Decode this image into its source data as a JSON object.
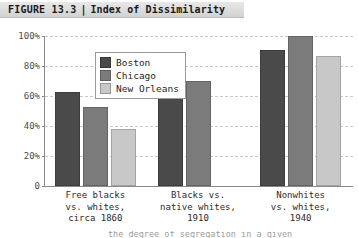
{
  "figure": {
    "label": "FIGURE 13.3",
    "separator": "|",
    "title": "Index of Dissimilarity",
    "caption_partial": "the degree of segregation in a given"
  },
  "colors": {
    "boston": "#4a4a4a",
    "chicago": "#7b7b7b",
    "new_orleans": "#c8c8c8",
    "axis": "#8a8a8a",
    "gridline": "#c9c9c9",
    "header_band": "#dcdcdc",
    "background": "#ffffff"
  },
  "legend": {
    "position": "top-left-inside",
    "entries": [
      {
        "label": "Boston",
        "color": "#4a4a4a"
      },
      {
        "label": "Chicago",
        "color": "#7b7b7b"
      },
      {
        "label": "New Orleans",
        "color": "#c8c8c8"
      }
    ]
  },
  "yaxis": {
    "ticks": [
      "0",
      "20%",
      "40%",
      "60%",
      "80%",
      "100%"
    ],
    "tick_values": [
      0,
      20,
      40,
      60,
      80,
      100
    ]
  },
  "chart_data": {
    "type": "bar",
    "title": "Index of Dissimilarity",
    "xlabel": "",
    "ylabel": "",
    "ylim": [
      0,
      100
    ],
    "grid": true,
    "legend_position": "top-left-inside",
    "categories": [
      "Free blacks vs. whites, circa 1860",
      "Blacks vs. native whites, 1910",
      "Nonwhites vs. whites, 1940"
    ],
    "category_lines": [
      [
        "Free blacks",
        "vs. whites,",
        "circa 1860"
      ],
      [
        "Blacks vs.",
        "native whites,",
        "1910"
      ],
      [
        "Nonwhites",
        "vs. whites,",
        "1940"
      ]
    ],
    "series": [
      {
        "name": "Boston",
        "color": "#4a4a4a",
        "values": [
          63,
          67,
          91
        ]
      },
      {
        "name": "Chicago",
        "color": "#7b7b7b",
        "values": [
          53,
          70,
          100
        ]
      },
      {
        "name": "New Orleans",
        "color": "#c8c8c8",
        "values": [
          38,
          null,
          87
        ]
      }
    ]
  }
}
